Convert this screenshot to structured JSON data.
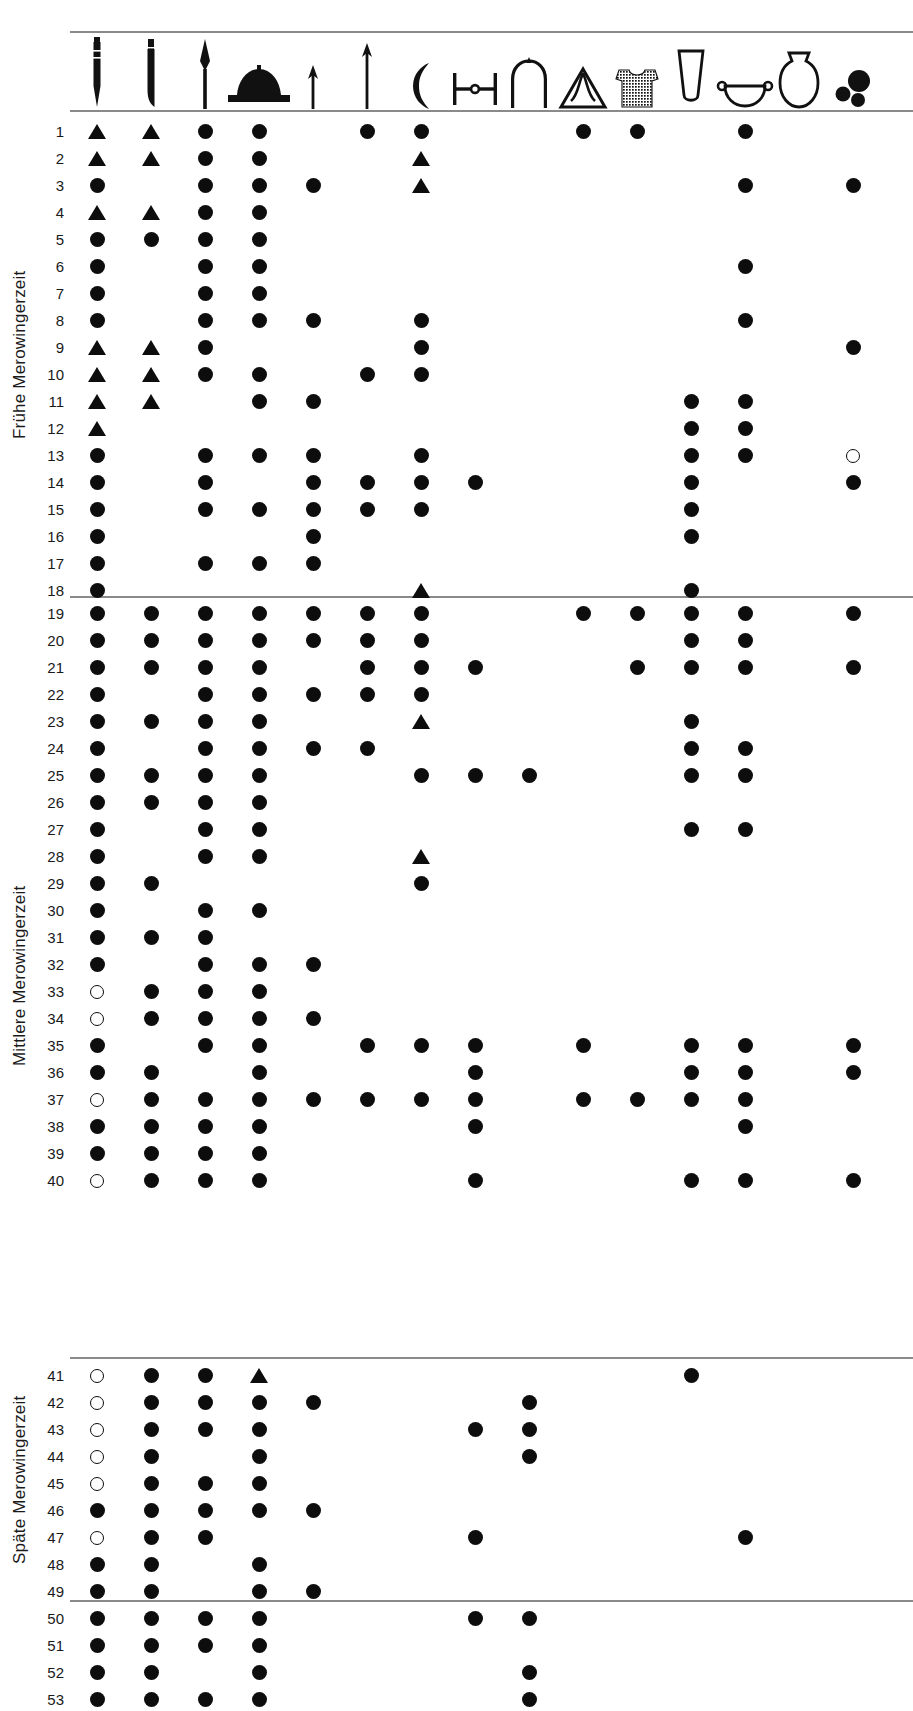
{
  "title": "DIE MEROWINGERZEIT",
  "layout": {
    "grid_left": 70,
    "col_width": 54,
    "first_col_center": 97,
    "row_height": 27,
    "sections_start_y": [
      118,
      600,
      1362
    ]
  },
  "colors": {
    "mark": "#0d0d0d",
    "rule": "#8a8a8a",
    "background": "#ffffff",
    "text": "#1a1a1a"
  },
  "legend": {
    "filled_circle": "present",
    "open_circle": "present-uncertain",
    "triangle": "present-variant"
  },
  "columns": [
    {
      "index": 1,
      "icon": "spatha-long-sword-icon",
      "label": "Spatha"
    },
    {
      "index": 2,
      "icon": "sax-short-sword-icon",
      "label": "Sax"
    },
    {
      "index": 3,
      "icon": "lance-head-icon",
      "label": "Lanzenspitze"
    },
    {
      "index": 4,
      "icon": "shield-boss-icon",
      "label": "Schildbuckel"
    },
    {
      "index": 5,
      "icon": "small-arrowhead-icon",
      "label": "Pfeilspitze klein"
    },
    {
      "index": 6,
      "icon": "large-arrowhead-icon",
      "label": "Pfeilspitze gross"
    },
    {
      "index": 7,
      "icon": "axe-francisca-icon",
      "label": "Franziska"
    },
    {
      "index": 8,
      "icon": "shield-grip-bar-icon",
      "label": "Schildfessel"
    },
    {
      "index": 9,
      "icon": "arched-buckle-icon",
      "label": "Buegel"
    },
    {
      "index": 10,
      "icon": "triangular-mount-icon",
      "label": "Dreieckbeschlag"
    },
    {
      "index": 11,
      "icon": "textile-tunic-icon",
      "label": "Textil"
    },
    {
      "index": 12,
      "icon": "conical-glass-beaker-icon",
      "label": "Glasbecher"
    },
    {
      "index": 13,
      "icon": "handled-bowl-icon",
      "label": "Schale mit Griff"
    },
    {
      "index": 14,
      "icon": "ceramic-vessel-icon",
      "label": "Keramikgefaess"
    },
    {
      "index": 15,
      "icon": "beads-cluster-icon",
      "label": "Perlen"
    }
  ],
  "sections": [
    {
      "id": "fruehe",
      "label": "Frühe Merowingerzeit",
      "rows": [
        {
          "num": "1",
          "marks": {
            "1": "tri",
            "2": "tri",
            "3": "filled",
            "4": "filled",
            "6": "filled",
            "7": "filled",
            "10": "filled",
            "11": "filled",
            "13": "filled"
          }
        },
        {
          "num": "2",
          "marks": {
            "1": "tri",
            "2": "tri",
            "3": "filled",
            "4": "filled",
            "7": "tri"
          }
        },
        {
          "num": "3",
          "marks": {
            "1": "filled",
            "3": "filled",
            "4": "filled",
            "5": "filled",
            "7": "tri",
            "13": "filled",
            "15": "filled"
          }
        },
        {
          "num": "4",
          "marks": {
            "1": "tri",
            "2": "tri",
            "3": "filled",
            "4": "filled"
          }
        },
        {
          "num": "5",
          "marks": {
            "1": "filled",
            "2": "filled",
            "3": "filled",
            "4": "filled"
          }
        },
        {
          "num": "6",
          "marks": {
            "1": "filled",
            "3": "filled",
            "4": "filled",
            "13": "filled"
          }
        },
        {
          "num": "7",
          "marks": {
            "1": "filled",
            "3": "filled",
            "4": "filled"
          }
        },
        {
          "num": "8",
          "marks": {
            "1": "filled",
            "3": "filled",
            "4": "filled",
            "5": "filled",
            "7": "filled",
            "13": "filled"
          }
        },
        {
          "num": "9",
          "marks": {
            "1": "tri",
            "2": "tri",
            "3": "filled",
            "7": "filled",
            "15": "filled"
          }
        },
        {
          "num": "10",
          "marks": {
            "1": "tri",
            "2": "tri",
            "3": "filled",
            "4": "filled",
            "6": "filled",
            "7": "filled"
          }
        },
        {
          "num": "11",
          "marks": {
            "1": "tri",
            "2": "tri",
            "4": "filled",
            "5": "filled",
            "12": "filled",
            "13": "filled"
          }
        },
        {
          "num": "12",
          "marks": {
            "1": "tri",
            "12": "filled",
            "13": "filled"
          }
        },
        {
          "num": "13",
          "marks": {
            "1": "filled",
            "3": "filled",
            "4": "filled",
            "5": "filled",
            "7": "filled",
            "12": "filled",
            "13": "filled",
            "15": "open"
          }
        },
        {
          "num": "14",
          "marks": {
            "1": "filled",
            "3": "filled",
            "5": "filled",
            "6": "filled",
            "7": "filled",
            "8": "filled",
            "12": "filled",
            "15": "filled"
          }
        },
        {
          "num": "15",
          "marks": {
            "1": "filled",
            "3": "filled",
            "4": "filled",
            "5": "filled",
            "6": "filled",
            "7": "filled",
            "12": "filled"
          }
        },
        {
          "num": "16",
          "marks": {
            "1": "filled",
            "5": "filled",
            "12": "filled"
          }
        },
        {
          "num": "17",
          "marks": {
            "1": "filled",
            "3": "filled",
            "4": "filled",
            "5": "filled"
          }
        },
        {
          "num": "18",
          "marks": {
            "1": "filled",
            "7": "tri",
            "12": "filled"
          }
        }
      ]
    },
    {
      "id": "mittlere",
      "label": "Mittlere Merowingerzeit",
      "rows": [
        {
          "num": "19",
          "marks": {
            "1": "filled",
            "2": "filled",
            "3": "filled",
            "4": "filled",
            "5": "filled",
            "6": "filled",
            "7": "filled",
            "10": "filled",
            "11": "filled",
            "12": "filled",
            "13": "filled",
            "15": "filled"
          }
        },
        {
          "num": "20",
          "marks": {
            "1": "filled",
            "2": "filled",
            "3": "filled",
            "4": "filled",
            "5": "filled",
            "6": "filled",
            "7": "filled",
            "12": "filled",
            "13": "filled"
          }
        },
        {
          "num": "21",
          "marks": {
            "1": "filled",
            "2": "filled",
            "3": "filled",
            "4": "filled",
            "6": "filled",
            "7": "filled",
            "8": "filled",
            "11": "filled",
            "12": "filled",
            "13": "filled",
            "15": "filled"
          }
        },
        {
          "num": "22",
          "marks": {
            "1": "filled",
            "3": "filled",
            "4": "filled",
            "5": "filled",
            "6": "filled",
            "7": "filled"
          }
        },
        {
          "num": "23",
          "marks": {
            "1": "filled",
            "2": "filled",
            "3": "filled",
            "4": "filled",
            "7": "tri",
            "12": "filled"
          }
        },
        {
          "num": "24",
          "marks": {
            "1": "filled",
            "3": "filled",
            "4": "filled",
            "5": "filled",
            "6": "filled",
            "12": "filled",
            "13": "filled"
          }
        },
        {
          "num": "25",
          "marks": {
            "1": "filled",
            "2": "filled",
            "3": "filled",
            "4": "filled",
            "7": "filled",
            "8": "filled",
            "9": "filled",
            "12": "filled",
            "13": "filled"
          }
        },
        {
          "num": "26",
          "marks": {
            "1": "filled",
            "2": "filled",
            "3": "filled",
            "4": "filled"
          }
        },
        {
          "num": "27",
          "marks": {
            "1": "filled",
            "3": "filled",
            "4": "filled",
            "12": "filled",
            "13": "filled"
          }
        },
        {
          "num": "28",
          "marks": {
            "1": "filled",
            "3": "filled",
            "4": "filled",
            "7": "tri"
          }
        },
        {
          "num": "29",
          "marks": {
            "1": "filled",
            "2": "filled",
            "7": "filled"
          }
        },
        {
          "num": "30",
          "marks": {
            "1": "filled",
            "3": "filled",
            "4": "filled"
          }
        },
        {
          "num": "31",
          "marks": {
            "1": "filled",
            "2": "filled",
            "3": "filled"
          }
        },
        {
          "num": "32",
          "marks": {
            "1": "filled",
            "3": "filled",
            "4": "filled",
            "5": "filled"
          }
        },
        {
          "num": "33",
          "marks": {
            "1": "open",
            "2": "filled",
            "3": "filled",
            "4": "filled"
          }
        },
        {
          "num": "34",
          "marks": {
            "1": "open",
            "2": "filled",
            "3": "filled",
            "4": "filled",
            "5": "filled"
          }
        },
        {
          "num": "35",
          "marks": {
            "1": "filled",
            "3": "filled",
            "4": "filled",
            "6": "filled",
            "7": "filled",
            "8": "filled",
            "10": "filled",
            "12": "filled",
            "13": "filled",
            "15": "filled"
          }
        },
        {
          "num": "36",
          "marks": {
            "1": "filled",
            "2": "filled",
            "4": "filled",
            "8": "filled",
            "12": "filled",
            "13": "filled",
            "15": "filled"
          }
        },
        {
          "num": "37",
          "marks": {
            "1": "open",
            "2": "filled",
            "3": "filled",
            "4": "filled",
            "5": "filled",
            "6": "filled",
            "7": "filled",
            "8": "filled",
            "10": "filled",
            "11": "filled",
            "12": "filled",
            "13": "filled"
          }
        },
        {
          "num": "38",
          "marks": {
            "1": "filled",
            "2": "filled",
            "3": "filled",
            "4": "filled",
            "8": "filled",
            "13": "filled"
          }
        },
        {
          "num": "39",
          "marks": {
            "1": "filled",
            "2": "filled",
            "3": "filled",
            "4": "filled"
          }
        },
        {
          "num": "40",
          "marks": {
            "1": "open",
            "2": "filled",
            "3": "filled",
            "4": "filled",
            "8": "filled",
            "12": "filled",
            "13": "filled",
            "15": "filled"
          }
        }
      ]
    },
    {
      "id": "spaete",
      "label": "Späte Merowingerzeit",
      "rows": [
        {
          "num": "41",
          "marks": {
            "1": "open",
            "2": "filled",
            "3": "filled",
            "4": "tri",
            "12": "filled"
          }
        },
        {
          "num": "42",
          "marks": {
            "1": "open",
            "2": "filled",
            "3": "filled",
            "4": "filled",
            "5": "filled",
            "9": "filled"
          }
        },
        {
          "num": "43",
          "marks": {
            "1": "open",
            "2": "filled",
            "3": "filled",
            "4": "filled",
            "8": "filled",
            "9": "filled"
          }
        },
        {
          "num": "44",
          "marks": {
            "1": "open",
            "2": "filled",
            "4": "filled",
            "9": "filled"
          }
        },
        {
          "num": "45",
          "marks": {
            "1": "open",
            "2": "filled",
            "3": "filled",
            "4": "filled"
          }
        },
        {
          "num": "46",
          "marks": {
            "1": "filled",
            "2": "filled",
            "3": "filled",
            "4": "filled",
            "5": "filled"
          }
        },
        {
          "num": "47",
          "marks": {
            "1": "open",
            "2": "filled",
            "3": "filled",
            "8": "filled",
            "13": "filled"
          }
        },
        {
          "num": "48",
          "marks": {
            "1": "filled",
            "2": "filled",
            "4": "filled"
          }
        },
        {
          "num": "49",
          "marks": {
            "1": "filled",
            "2": "filled",
            "4": "filled",
            "5": "filled"
          }
        },
        {
          "num": "50",
          "marks": {
            "1": "filled",
            "2": "filled",
            "3": "filled",
            "4": "filled",
            "8": "filled",
            "9": "filled"
          }
        },
        {
          "num": "51",
          "marks": {
            "1": "filled",
            "2": "filled",
            "3": "filled",
            "4": "filled"
          }
        },
        {
          "num": "52",
          "marks": {
            "1": "filled",
            "2": "filled",
            "4": "filled",
            "9": "filled"
          }
        },
        {
          "num": "53",
          "marks": {
            "1": "filled",
            "2": "filled",
            "3": "filled",
            "4": "filled",
            "9": "filled"
          }
        }
      ]
    }
  ],
  "chart_data": {
    "type": "table",
    "title": "DIE MEROWINGERZEIT",
    "xlabel": "Fundtypen (Grabbeigaben)",
    "ylabel": "Grabnummer",
    "grid": false,
    "legend_position": "none",
    "row_count": 53,
    "column_count": 15
  }
}
